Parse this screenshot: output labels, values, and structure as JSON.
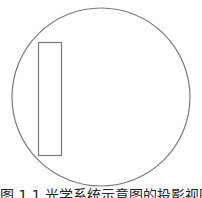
{
  "figure": {
    "shapes": {
      "circle": {
        "cx": 101,
        "cy": 97,
        "r": 89,
        "stroke": "#7a7a7a"
      },
      "rectangle": {
        "x": 38,
        "y": 42,
        "width": 23,
        "height": 113,
        "stroke": "#7a7a7a"
      }
    },
    "caption": "图 1.1  光学系统示意图的投影视图"
  }
}
